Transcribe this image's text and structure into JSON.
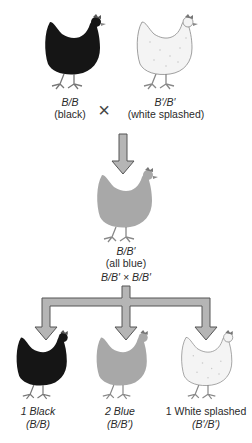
{
  "parents": {
    "left": {
      "genotype": "B/B",
      "phenotype": "(black)",
      "color": "#151515"
    },
    "right": {
      "genotype": "B′/B′",
      "phenotype": "(white splashed)",
      "color": "#f4f4f4"
    },
    "cross_symbol": "×"
  },
  "f1": {
    "genotype": "B/B′",
    "phenotype": "(all blue)",
    "color": "#a8a8a8",
    "cross": "B/B′ × B/B′"
  },
  "f2": [
    {
      "label": "1 Black",
      "genotype": "(B/B)",
      "color": "#151515"
    },
    {
      "label": "2 Blue",
      "genotype": "(B/B′)",
      "color": "#a8a8a8"
    },
    {
      "label": "1 White splashed",
      "genotype": "(B′/B′)",
      "color": "#f4f4f4"
    }
  ],
  "arrow_color": "#b5b5b5"
}
